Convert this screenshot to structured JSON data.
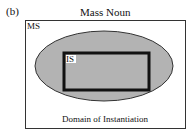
{
  "figure": {
    "panel_label": "(b)",
    "title": "Mass Noun",
    "outer_box_label": "MS",
    "inner_box_label": "IS",
    "bottom_label": "Domain of Instantiation"
  },
  "colors": {
    "ellipse_fill": "#b3b3b3",
    "ellipse_stroke": "#333333",
    "outer_box_stroke": "#333333",
    "inner_box_stroke": "#111111",
    "label_bg": "#ffffff"
  }
}
